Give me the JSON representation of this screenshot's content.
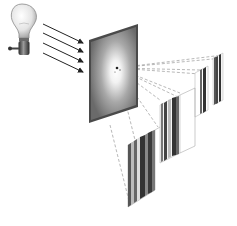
{
  "diagram": {
    "elements": {
      "light_source": {
        "type": "light-bulb",
        "position": "top-left"
      },
      "rays": {
        "count": 4,
        "style": "arrow",
        "direction": "toward screen"
      },
      "screen": {
        "type": "square-panel",
        "fill": "radial gradient white center to gray edge"
      },
      "projection_lines": {
        "style": "dashed",
        "origin": "screen center"
      },
      "stripe_planes": {
        "count": 4,
        "pattern": "vertical bars",
        "arrangement": "receding diagonally to upper right"
      }
    },
    "colors": {
      "background": "#ffffff",
      "screen_edge": "#4a4a4a",
      "screen_center": "#ffffff",
      "screen_mid": "#8a8a8a",
      "stripe_dark": "#333333",
      "stripe_mid": "#777777",
      "stripe_light": "#dddddd",
      "dashed_line": "#9a9a9a",
      "bulb_glass": "#eeeeee",
      "bulb_base": "#444444"
    }
  }
}
